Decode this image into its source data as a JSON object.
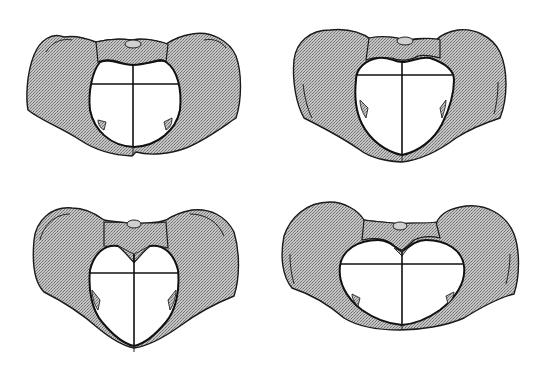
{
  "figure": {
    "colors": {
      "bone_fill": "#b8b8b8",
      "outline": "#1a1a1a",
      "inlet": "#ffffff"
    },
    "panels": [
      {
        "id": "top-left",
        "shape": "round inlet (gynecoid-like)"
      },
      {
        "id": "top-right",
        "shape": "heart-shaped inlet (android-like)"
      },
      {
        "id": "bottom-left",
        "shape": "narrow oval inlet (anthropoid-like)"
      },
      {
        "id": "bottom-right",
        "shape": "wide flat inlet (platypelloid-like)"
      }
    ]
  }
}
